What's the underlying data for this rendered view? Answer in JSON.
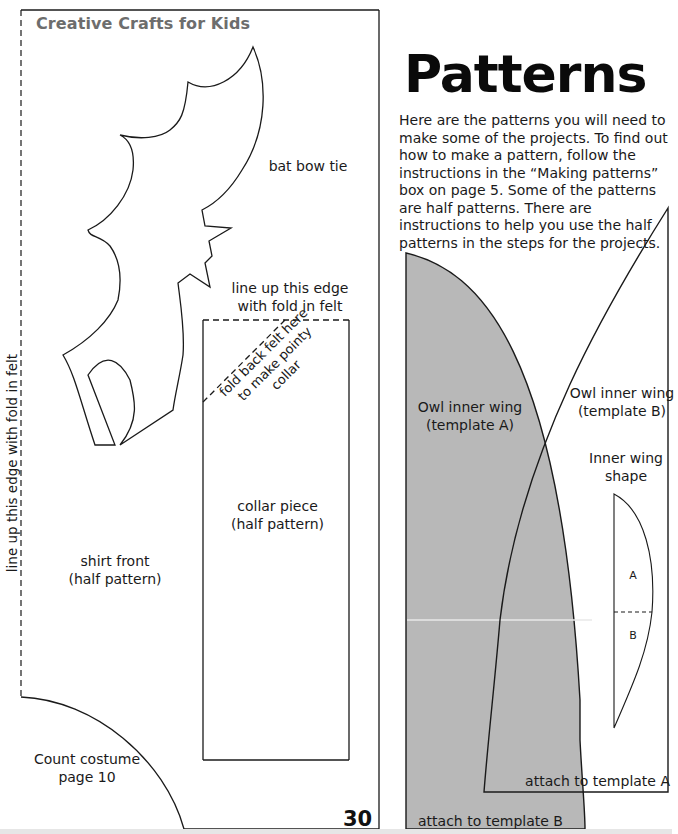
{
  "left_page": {
    "header": "Creative Crafts for Kids",
    "page_number": "30",
    "fold_edge_label": "line up this edge with fold in felt",
    "labels": {
      "bat_bow_tie": "bat bow tie",
      "collar_edge_line1": "line up this edge",
      "collar_edge_line2": "with fold in felt",
      "fold_back_line1": "fold back felt here",
      "fold_back_line2": "to make pointy",
      "fold_back_line3": "collar",
      "collar_piece_line1": "collar piece",
      "collar_piece_line2": "(half pattern)",
      "shirt_front_line1": "shirt front",
      "shirt_front_line2": "(half pattern)",
      "count_costume_line1": "Count costume",
      "count_costume_line2": "page 10"
    }
  },
  "right_page": {
    "title": "Patterns",
    "intro": "Here are the patterns you will need to make some of the projects. To find out how to make a pattern, follow the instructions in the “Making patterns” box on page 5. Some of the patterns are half patterns. There are instructions to help you use the half patterns in the steps for the projects.",
    "labels": {
      "template_a_line1": "Owl inner wing",
      "template_a_line2": "(template A)",
      "template_b_line1": "Owl inner wing",
      "template_b_line2": "(template B)",
      "inner_wing_line1": "Inner wing",
      "inner_wing_line2": "shape",
      "section_a": "A",
      "section_b": "B",
      "attach_a": "attach to template A",
      "attach_b": "attach to template B"
    },
    "colors": {
      "template_a_fill": "#b8b8b8",
      "outline": "#1a1a1a"
    }
  }
}
